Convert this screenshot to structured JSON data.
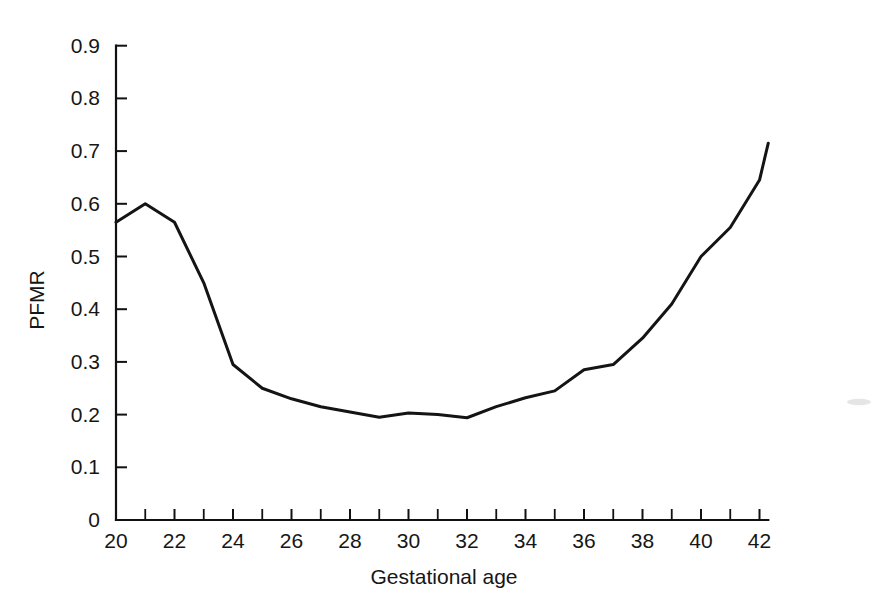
{
  "figure": {
    "background_color": "#ffffff",
    "line_color": "#141414",
    "axis_color": "#111111",
    "text_color": "#161616"
  },
  "chart_data": {
    "type": "line",
    "title": "",
    "xlabel": "Gestational age",
    "ylabel": "PFMR",
    "xlim": [
      19.6,
      42.6
    ],
    "ylim": [
      0,
      0.9
    ],
    "grid": false,
    "legend": null,
    "x_tick_labels": [
      "20",
      "22",
      "24",
      "26",
      "28",
      "30",
      "32",
      "34",
      "36",
      "38",
      "40",
      "42"
    ],
    "x_tick_values": [
      20,
      22,
      24,
      26,
      28,
      30,
      32,
      34,
      36,
      38,
      40,
      42
    ],
    "x_minor_tick_values": [
      21,
      23,
      25,
      27,
      29,
      31,
      33,
      35,
      37,
      39,
      41
    ],
    "y_tick_labels": [
      "0",
      "0.1",
      "0.2",
      "0.3",
      "0.4",
      "0.5",
      "0.6",
      "0.7",
      "0.8",
      "0.9"
    ],
    "y_tick_values": [
      0,
      0.1,
      0.2,
      0.3,
      0.4,
      0.5,
      0.6,
      0.7,
      0.8,
      0.9
    ],
    "x": [
      20,
      21,
      22,
      23,
      24,
      25,
      26,
      27,
      28,
      29,
      30,
      31,
      32,
      33,
      34,
      35,
      36,
      37,
      38,
      39,
      40,
      41,
      42,
      42.3
    ],
    "values": [
      0.565,
      0.6,
      0.565,
      0.45,
      0.295,
      0.25,
      0.23,
      0.215,
      0.205,
      0.195,
      0.203,
      0.2,
      0.194,
      0.215,
      0.232,
      0.245,
      0.285,
      0.295,
      0.345,
      0.41,
      0.5,
      0.555,
      0.645,
      0.715
    ],
    "series": [
      {
        "name": "PFMR",
        "values": [
          0.565,
          0.6,
          0.565,
          0.45,
          0.295,
          0.25,
          0.23,
          0.215,
          0.205,
          0.195,
          0.203,
          0.2,
          0.194,
          0.215,
          0.232,
          0.245,
          0.285,
          0.295,
          0.345,
          0.41,
          0.5,
          0.555,
          0.645,
          0.715
        ]
      }
    ]
  }
}
